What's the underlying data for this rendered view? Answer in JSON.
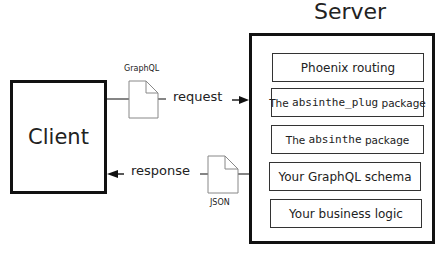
{
  "server": {
    "title": "Server",
    "layers": [
      {
        "prefix": "Phoenix routing",
        "mono": "",
        "suffix": ""
      },
      {
        "prefix": "The ",
        "mono": "absinthe_plug",
        "suffix": " package"
      },
      {
        "prefix": "The ",
        "mono": "absinthe",
        "suffix": " package"
      },
      {
        "prefix": "Your GraphQL schema",
        "mono": "",
        "suffix": ""
      },
      {
        "prefix": "Your business logic",
        "mono": "",
        "suffix": ""
      }
    ]
  },
  "client": {
    "title": "Client"
  },
  "request": {
    "label": "request",
    "document_label": "GraphQL",
    "document_icon": "document-icon"
  },
  "response": {
    "label": "response",
    "document_label": "JSON",
    "document_icon": "document-icon"
  }
}
